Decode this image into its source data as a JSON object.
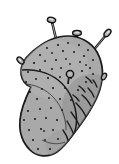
{
  "figure": {
    "subject": "potato",
    "style": "hand-drawn black ink line illustration with flat gray fill",
    "alt_text": "A line drawing of an elongated kidney-shaped potato tilted diagonally, speckled with small dark eyes, with five nails and pins driven into it.",
    "background_color": "#ffffff",
    "canvas": {
      "width": 119,
      "height": 164
    }
  },
  "colors": {
    "background": "#ffffff",
    "outline": "#1a1a1a",
    "body_fill": "#a8a8a8",
    "body_fill_light": "#b8b8b8",
    "body_shadow": "#8f8f8f",
    "speckle": "#1c1c1c",
    "nail_fill": "#9a9a9a",
    "nail_outline": "#151515",
    "nail_highlight": "#d0d0d0"
  },
  "body": {
    "name": "potato-body",
    "description": "elongated bean/kidney silhouette running from upper right to lower left",
    "outline_width": 1.6,
    "interior_lines": 3,
    "speckle_count": 58
  },
  "nails": [
    {
      "id": "nail-top-left",
      "label": "tall nail, upper left",
      "head_position": {
        "x": 51,
        "y": 19
      },
      "tip_position": {
        "x": 60,
        "y": 57
      },
      "angle_deg": 13,
      "length": 40,
      "head_style": "flat-round"
    },
    {
      "id": "nail-top-center",
      "label": "short nail at top edge, seen nearly end-on",
      "head_position": {
        "x": 77,
        "y": 33
      },
      "tip_position": {
        "x": 78,
        "y": 44
      },
      "angle_deg": 4,
      "length": 11,
      "head_style": "flat-round"
    },
    {
      "id": "nail-top-right",
      "label": "nail angled down-left from upper right",
      "head_position": {
        "x": 108,
        "y": 33
      },
      "tip_position": {
        "x": 88,
        "y": 56
      },
      "angle_deg": 130,
      "length": 30,
      "head_style": "flat-round"
    },
    {
      "id": "nail-left",
      "label": "nail angled down-right on the left flank",
      "head_position": {
        "x": 20,
        "y": 60
      },
      "tip_position": {
        "x": 36,
        "y": 76
      },
      "angle_deg": 45,
      "length": 23,
      "head_style": "flat-round"
    },
    {
      "id": "nail-right-small",
      "label": "small pin head on right edge",
      "head_position": {
        "x": 103,
        "y": 76
      },
      "tip_position": {
        "x": 96,
        "y": 80
      },
      "angle_deg": 150,
      "length": 9,
      "head_style": "flat-round"
    },
    {
      "id": "pin-center",
      "label": "pin seen head-on in the middle of the potato",
      "head_position": {
        "x": 70,
        "y": 74
      },
      "tip_position": {
        "x": 69,
        "y": 82
      },
      "angle_deg": 0,
      "length": 9,
      "head_style": "ring"
    }
  ]
}
